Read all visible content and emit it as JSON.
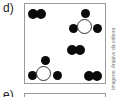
{
  "panels": [
    {
      "label": "d)",
      "description": "Box containing molecules: diatomic black pairs and tetra-atomic molecules (white central atom with three black atoms)"
    },
    {
      "label": "e)"
    }
  ],
  "panel_d": {
    "molecules": [
      {
        "type": "diatomic-black",
        "position": "top-left"
      },
      {
        "type": "white-center-three-black",
        "position": "top-right"
      },
      {
        "type": "diatomic-black",
        "position": "middle-right"
      },
      {
        "type": "white-center-three-black",
        "position": "bottom-left"
      },
      {
        "type": "diatomic-black",
        "position": "bottom-right"
      }
    ]
  },
  "credit": "Imagens: Arquivo da editora",
  "colors": {
    "atom_black": "#0a0a0a",
    "atom_white": "#ffffff",
    "border": "#9a9a9a"
  }
}
